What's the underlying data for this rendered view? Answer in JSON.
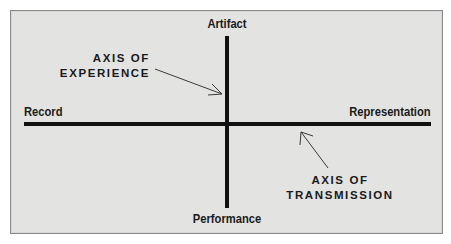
{
  "diagram": {
    "axis_labels": {
      "top": "Artifact",
      "bottom": "Performance",
      "left": "Record",
      "right": "Representation"
    },
    "captions": {
      "experience": {
        "line1": "AXIS OF",
        "line2": "EXPERIENCE"
      },
      "transmission": {
        "line1": "AXIS OF",
        "line2": "TRANSMISSION"
      }
    },
    "colors": {
      "background": "#e3e3e2",
      "border": "#8a8a8a",
      "axis": "#111111",
      "text": "#1a1a1a"
    }
  }
}
